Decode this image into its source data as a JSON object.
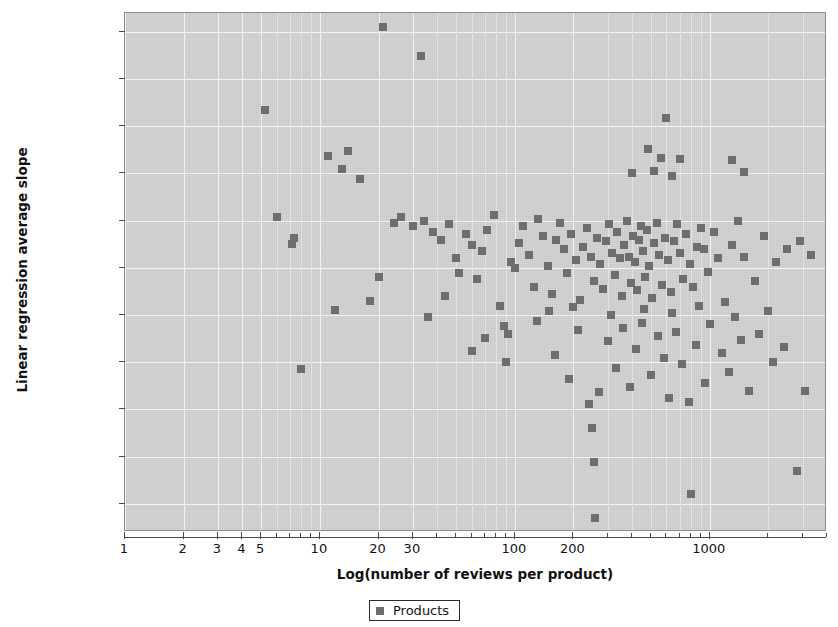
{
  "chart_data": {
    "type": "scatter",
    "title": "",
    "xlabel": "Log(number of reviews per product)",
    "ylabel": "Linear regression average slope",
    "xscale": "log",
    "xlim": [
      1,
      4000
    ],
    "ylim": [
      -3.8e-06,
      1.7e-06
    ],
    "grid": true,
    "legend_position": "bottom-center",
    "decimal_separator": ",",
    "x_tick_labels": [
      "1",
      "2",
      "3",
      "4",
      "5",
      "10",
      "20",
      "30",
      "100",
      "200",
      "1000"
    ],
    "x_tick_values": [
      1,
      2,
      3,
      4,
      5,
      10,
      20,
      30,
      100,
      200,
      1000
    ],
    "y_tick_labels": [
      "0,0000015",
      "0,0000010",
      "0,0000005",
      "0,0000000",
      "-0,0000005",
      "-0,0000010",
      "-0,0000015",
      "-0,0000020",
      "-0,0000025",
      "-0,0000030",
      "-0,0000035"
    ],
    "y_tick_values": [
      1.5e-06,
      1e-06,
      5e-07,
      0.0,
      -5e-07,
      -1e-06,
      -1.5e-06,
      -2e-06,
      -2.5e-06,
      -3e-06,
      -3.5e-06
    ],
    "series": [
      {
        "name": "Products",
        "marker": "square",
        "color": "#6e6e6e",
        "points": [
          [
            21,
            1.55e-06
          ],
          [
            33,
            1.25e-06
          ],
          [
            5.2,
            6.7e-07
          ],
          [
            600,
            5.9e-07
          ],
          [
            11,
            1.9e-07
          ],
          [
            14,
            2.4e-07
          ],
          [
            480,
            2.6e-07
          ],
          [
            560,
            1.6e-07
          ],
          [
            700,
            1.5e-07
          ],
          [
            1300,
            1.4e-07
          ],
          [
            13,
            5e-08
          ],
          [
            16,
            -6e-08
          ],
          [
            400,
            1e-08
          ],
          [
            520,
            3e-08
          ],
          [
            640,
            -3e-08
          ],
          [
            1500,
            2e-08
          ],
          [
            6.0,
            -4.6e-07
          ],
          [
            7.2,
            -7.5e-07
          ],
          [
            7.4,
            -6.8e-07
          ],
          [
            8.0,
            -2.07e-06
          ],
          [
            12,
            -1.45e-06
          ],
          [
            18,
            -1.35e-06
          ],
          [
            20,
            -1.1e-06
          ],
          [
            24,
            -5.2e-07
          ],
          [
            26,
            -4.6e-07
          ],
          [
            30,
            -5.6e-07
          ],
          [
            34,
            -5e-07
          ],
          [
            38,
            -6.2e-07
          ],
          [
            42,
            -7e-07
          ],
          [
            46,
            -5.4e-07
          ],
          [
            50,
            -9e-07
          ],
          [
            52,
            -1.05e-06
          ],
          [
            56,
            -6.4e-07
          ],
          [
            60,
            -7.6e-07
          ],
          [
            64,
            -1.12e-06
          ],
          [
            68,
            -8.2e-07
          ],
          [
            72,
            -6e-07
          ],
          [
            78,
            -4.4e-07
          ],
          [
            84,
            -1.4e-06
          ],
          [
            88,
            -1.62e-06
          ],
          [
            92,
            -1.7e-06
          ],
          [
            96,
            -9.4e-07
          ],
          [
            100,
            -1e-06
          ],
          [
            105,
            -7.4e-07
          ],
          [
            110,
            -5.6e-07
          ],
          [
            118,
            -8.6e-07
          ],
          [
            125,
            -1.2e-06
          ],
          [
            132,
            -4.8e-07
          ],
          [
            140,
            -6.6e-07
          ],
          [
            148,
            -9.8e-07
          ],
          [
            155,
            -1.28e-06
          ],
          [
            162,
            -7e-07
          ],
          [
            170,
            -5.2e-07
          ],
          [
            178,
            -8e-07
          ],
          [
            186,
            -1.06e-06
          ],
          [
            195,
            -6.4e-07
          ],
          [
            205,
            -9.2e-07
          ],
          [
            215,
            -1.34e-06
          ],
          [
            225,
            -7.8e-07
          ],
          [
            235,
            -5.8e-07
          ],
          [
            245,
            -8.8e-07
          ],
          [
            255,
            -1.14e-06
          ],
          [
            265,
            -6.8e-07
          ],
          [
            275,
            -9.6e-07
          ],
          [
            285,
            -1.22e-06
          ],
          [
            295,
            -7.2e-07
          ],
          [
            305,
            -5.4e-07
          ],
          [
            315,
            -8.4e-07
          ],
          [
            325,
            -1.08e-06
          ],
          [
            335,
            -6.2e-07
          ],
          [
            345,
            -9e-07
          ],
          [
            355,
            -1.3e-06
          ],
          [
            365,
            -7.6e-07
          ],
          [
            375,
            -5e-07
          ],
          [
            385,
            -8.8e-07
          ],
          [
            395,
            -1.16e-06
          ],
          [
            405,
            -6.6e-07
          ],
          [
            415,
            -9.4e-07
          ],
          [
            425,
            -1.24e-06
          ],
          [
            435,
            -7e-07
          ],
          [
            445,
            -5.6e-07
          ],
          [
            455,
            -8.2e-07
          ],
          [
            465,
            -1.1e-06
          ],
          [
            475,
            -6e-07
          ],
          [
            490,
            -9.8e-07
          ],
          [
            505,
            -1.32e-06
          ],
          [
            520,
            -7.4e-07
          ],
          [
            535,
            -5.2e-07
          ],
          [
            550,
            -8.6e-07
          ],
          [
            570,
            -1.18e-06
          ],
          [
            590,
            -6.8e-07
          ],
          [
            610,
            -9.2e-07
          ],
          [
            630,
            -1.26e-06
          ],
          [
            655,
            -7.2e-07
          ],
          [
            680,
            -5.4e-07
          ],
          [
            700,
            -8.4e-07
          ],
          [
            730,
            -1.12e-06
          ],
          [
            760,
            -6.4e-07
          ],
          [
            790,
            -9.6e-07
          ],
          [
            820,
            -1.2e-06
          ],
          [
            860,
            -7.8e-07
          ],
          [
            900,
            -5.8e-07
          ],
          [
            940,
            -8e-07
          ],
          [
            980,
            -1.04e-06
          ],
          [
            1050,
            -6.2e-07
          ],
          [
            1100,
            -9e-07
          ],
          [
            1200,
            -1.36e-06
          ],
          [
            1300,
            -7.6e-07
          ],
          [
            1400,
            -5e-07
          ],
          [
            1500,
            -8.8e-07
          ],
          [
            1700,
            -1.14e-06
          ],
          [
            1900,
            -6.6e-07
          ],
          [
            2200,
            -9.4e-07
          ],
          [
            2500,
            -8e-07
          ],
          [
            2900,
            -7.2e-07
          ],
          [
            3300,
            -8.6e-07
          ],
          [
            60,
            -1.88e-06
          ],
          [
            70,
            -1.74e-06
          ],
          [
            90,
            -2e-06
          ],
          [
            130,
            -1.56e-06
          ],
          [
            160,
            -1.92e-06
          ],
          [
            190,
            -2.18e-06
          ],
          [
            210,
            -1.66e-06
          ],
          [
            240,
            -2.44e-06
          ],
          [
            250,
            -2.7e-06
          ],
          [
            255,
            -3.06e-06
          ],
          [
            258,
            -3.65e-06
          ],
          [
            270,
            -2.32e-06
          ],
          [
            300,
            -1.78e-06
          ],
          [
            330,
            -2.06e-06
          ],
          [
            360,
            -1.64e-06
          ],
          [
            390,
            -2.26e-06
          ],
          [
            420,
            -1.86e-06
          ],
          [
            450,
            -1.58e-06
          ],
          [
            500,
            -2.14e-06
          ],
          [
            540,
            -1.72e-06
          ],
          [
            580,
            -1.96e-06
          ],
          [
            620,
            -2.38e-06
          ],
          [
            670,
            -1.68e-06
          ],
          [
            720,
            -2.02e-06
          ],
          [
            780,
            -2.42e-06
          ],
          [
            800,
            -3.4e-06
          ],
          [
            850,
            -1.82e-06
          ],
          [
            950,
            -2.22e-06
          ],
          [
            1000,
            -1.6e-06
          ],
          [
            1150,
            -1.9e-06
          ],
          [
            1250,
            -2.1e-06
          ],
          [
            1450,
            -1.76e-06
          ],
          [
            1600,
            -2.3e-06
          ],
          [
            1800,
            -1.7e-06
          ],
          [
            2100,
            -2e-06
          ],
          [
            2400,
            -1.84e-06
          ],
          [
            2800,
            -3.15e-06
          ],
          [
            3100,
            -2.3e-06
          ],
          [
            36,
            -1.52e-06
          ],
          [
            44,
            -1.3e-06
          ],
          [
            150,
            -1.46e-06
          ],
          [
            200,
            -1.42e-06
          ],
          [
            310,
            -1.5e-06
          ],
          [
            460,
            -1.44e-06
          ],
          [
            640,
            -1.48e-06
          ],
          [
            880,
            -1.4e-06
          ],
          [
            1350,
            -1.52e-06
          ],
          [
            2000,
            -1.46e-06
          ]
        ]
      }
    ]
  },
  "axes": {
    "y_title": "Linear regression average slope",
    "x_title": "Log(number of reviews per product)"
  },
  "legend": {
    "entries": [
      {
        "label": "Products",
        "color": "#6e6e6e"
      }
    ]
  },
  "colors": {
    "plot_background": "#d2d2d2",
    "gridline": "#f2f2f2",
    "marker": "#6e6e6e",
    "axis": "#4a4a4a",
    "text": "#141414"
  }
}
